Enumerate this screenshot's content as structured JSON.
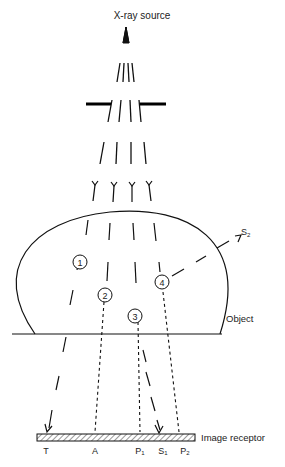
{
  "diagram": {
    "title": "X-ray source",
    "object_label": "Object",
    "receptor_label": "Image receptor",
    "scatter_label": "S",
    "scatter_sub": "2",
    "circle_labels": [
      "1",
      "2",
      "3",
      "4"
    ],
    "receptor_points": [
      {
        "name": "T",
        "sub": ""
      },
      {
        "name": "A",
        "sub": ""
      },
      {
        "name": "P",
        "sub": "1"
      },
      {
        "name": "S",
        "sub": "1"
      },
      {
        "name": "P",
        "sub": "2"
      }
    ]
  }
}
